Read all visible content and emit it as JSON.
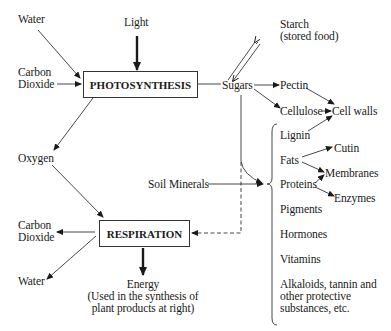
{
  "diagram": {
    "inputs": {
      "water": "Water",
      "light": "Light",
      "carbon_dioxide_line1": "Carbon",
      "carbon_dioxide_line2": "Dioxide",
      "soil_minerals": "Soil Minerals"
    },
    "processes": {
      "photosynthesis": "PHOTOSYNTHESIS",
      "respiration": "RESPIRATION"
    },
    "intermediates": {
      "sugars": "Sugars",
      "oxygen": "Oxygen",
      "starch_line1": "Starch",
      "starch_line2": "(stored food)"
    },
    "cell_wall_branch": {
      "pectin": "Pectin",
      "cellulose": "Cellulose",
      "cell_walls": "Cell walls"
    },
    "plant_products": {
      "lignin": "Lignin",
      "fats": "Fats",
      "proteins": "Proteins",
      "pigments": "Pigments",
      "hormones": "Hormones",
      "vitamins": "Vitamins",
      "alkaloids_line1": "Alkaloids, tannin and",
      "alkaloids_line2": "other protective",
      "alkaloids_line3": "substances,  etc."
    },
    "derived_products": {
      "cutin": "Cutin",
      "membranes": "Membranes",
      "enzymes": "Enzymes"
    },
    "respiration_outputs": {
      "carbon_dioxide_line1": "Carbon",
      "carbon_dioxide_line2": "Dioxide",
      "water": "Water",
      "energy_line1": "Energy",
      "energy_line2": "(Used in the synthesis of",
      "energy_line3": "plant products at right)"
    },
    "colors": {
      "ink": "#1a1a1a",
      "background": "#ffffff"
    }
  }
}
